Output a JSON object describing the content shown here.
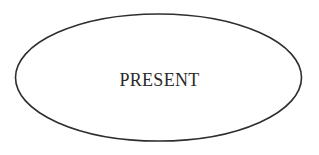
{
  "diagram": {
    "node": {
      "shape": "ellipse",
      "label": "PRESENT",
      "stroke_color": "#2e2e2e",
      "fill_color": "#ffffff",
      "text_color": "#2a2a2a"
    }
  }
}
